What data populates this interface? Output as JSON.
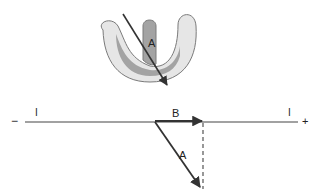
{
  "figure": {
    "heart_illustration": {
      "vector_label": "A",
      "colors": {
        "outer_fill": "#e6e6e6",
        "inner_fill": "#a3a3a3",
        "outline": "#7a7a7a",
        "vector": "#333333"
      }
    },
    "axis": {
      "negative_sign": "−",
      "positive_sign": "+",
      "left_lead_label": "I",
      "right_lead_label": "I"
    },
    "vectors": {
      "projection_label": "B",
      "main_label": "A",
      "color": "#333333",
      "dashed_projection": true
    }
  }
}
